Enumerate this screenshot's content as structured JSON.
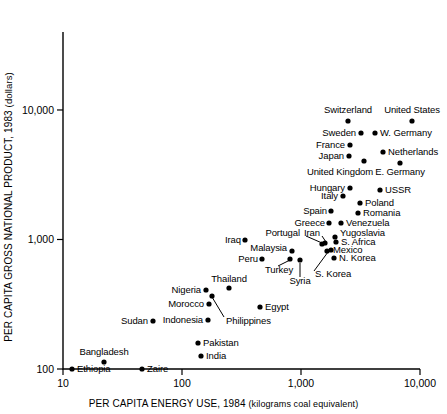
{
  "chart_data": {
    "type": "scatter",
    "title": "",
    "xlabel": "PER CAPITA ENERGY USE, 1984",
    "xlabel_unit": "(kilograms coal equivalent)",
    "ylabel": "PER CAPITA GROSS NATIONAL PRODUCT, 1983",
    "ylabel_unit": "(dollars)",
    "xscale": "log",
    "yscale": "log",
    "xlim": [
      10,
      10000
    ],
    "ylim": [
      100,
      40000
    ],
    "grid": false,
    "legend": "none",
    "xticks": [
      {
        "value": 10,
        "label": "10"
      },
      {
        "value": 100,
        "label": "100"
      },
      {
        "value": 1000,
        "label": "1,000"
      },
      {
        "value": 10000,
        "label": "10,000"
      }
    ],
    "yticks": [
      {
        "value": 100,
        "label": "100"
      },
      {
        "value": 1000,
        "label": "1,000"
      },
      {
        "value": 10000,
        "label": "10,000"
      }
    ],
    "points": [
      {
        "name": "Switzerland",
        "x": 4000,
        "y": 16800,
        "label_pos": "above",
        "px": 348,
        "py": 121,
        "lx": 348,
        "ly": 110,
        "anchor": "c"
      },
      {
        "name": "United States",
        "x": 9500,
        "y": 16800,
        "label_pos": "above",
        "px": 412,
        "py": 121,
        "lx": 412,
        "ly": 110,
        "anchor": "c"
      },
      {
        "name": "Sweden",
        "x": 4700,
        "y": 12500,
        "label_pos": "left",
        "px": 361,
        "py": 133,
        "lx": 356,
        "ly": 133,
        "anchor": "r"
      },
      {
        "name": "W. Germany",
        "x": 5400,
        "y": 12500,
        "label_pos": "right",
        "px": 375,
        "py": 133,
        "lx": 380,
        "ly": 133,
        "anchor": "l"
      },
      {
        "name": "France",
        "x": 4000,
        "y": 10200,
        "label_pos": "left",
        "px": 350,
        "py": 145,
        "lx": 345,
        "ly": 145,
        "anchor": "r"
      },
      {
        "name": "Netherlands",
        "x": 6600,
        "y": 9200,
        "label_pos": "right",
        "px": 383,
        "py": 152,
        "lx": 388,
        "ly": 152,
        "anchor": "l"
      },
      {
        "name": "Japan",
        "x": 4000,
        "y": 9100,
        "label_pos": "left",
        "px": 349,
        "py": 156,
        "lx": 344,
        "ly": 156,
        "anchor": "r"
      },
      {
        "name": "United Kingdom",
        "x": 4800,
        "y": 8200,
        "label_pos": "below",
        "px": 364,
        "py": 161,
        "lx": 340,
        "ly": 172,
        "anchor": "c"
      },
      {
        "name": "E. Germany",
        "x": 7800,
        "y": 8000,
        "label_pos": "below",
        "px": 400,
        "py": 163,
        "lx": 400,
        "ly": 172,
        "anchor": "c"
      },
      {
        "name": "Hungary",
        "x": 4100,
        "y": 5000,
        "label_pos": "left",
        "px": 350,
        "py": 188,
        "lx": 345,
        "ly": 188,
        "anchor": "r"
      },
      {
        "name": "USSR",
        "x": 5900,
        "y": 4900,
        "label_pos": "right",
        "px": 380,
        "py": 190,
        "lx": 385,
        "ly": 190,
        "anchor": "l"
      },
      {
        "name": "Italy",
        "x": 3400,
        "y": 4400,
        "label_pos": "left",
        "px": 343,
        "py": 196,
        "lx": 338,
        "ly": 196,
        "anchor": "r"
      },
      {
        "name": "Poland",
        "x": 4600,
        "y": 3700,
        "label_pos": "right",
        "px": 360,
        "py": 203,
        "lx": 365,
        "ly": 203,
        "anchor": "l"
      },
      {
        "name": "Spain",
        "x": 2700,
        "y": 3200,
        "label_pos": "left",
        "px": 331,
        "py": 211,
        "lx": 327,
        "ly": 211,
        "anchor": "r"
      },
      {
        "name": "Romania",
        "x": 4400,
        "y": 3100,
        "label_pos": "right",
        "px": 358,
        "py": 213,
        "lx": 363,
        "ly": 213,
        "anchor": "l"
      },
      {
        "name": "Greece",
        "x": 2500,
        "y": 2500,
        "label_pos": "left",
        "px": 329,
        "py": 223,
        "lx": 325,
        "ly": 223,
        "anchor": "r"
      },
      {
        "name": "Venezuela",
        "x": 3000,
        "y": 2500,
        "label_pos": "right",
        "px": 341,
        "py": 223,
        "lx": 346,
        "ly": 223,
        "anchor": "l"
      },
      {
        "name": "Yugoslavia",
        "x": 2200,
        "y": 1900,
        "label_pos": "right",
        "px": 335,
        "py": 237,
        "lx": 340,
        "ly": 233,
        "anchor": "l"
      },
      {
        "name": "S. Africa",
        "x": 2300,
        "y": 1700,
        "label_pos": "right",
        "px": 336,
        "py": 242,
        "lx": 341,
        "ly": 242,
        "anchor": "l"
      },
      {
        "name": "Iran",
        "x": 1700,
        "y": 1600,
        "label_pos": "leader",
        "px": 325,
        "py": 243,
        "lx": 320,
        "ly": 233,
        "anchor": "r"
      },
      {
        "name": "Portugal",
        "x": 1100,
        "y": 1600,
        "label_pos": "leader",
        "px": 322,
        "py": 244,
        "lx": 300,
        "ly": 233,
        "anchor": "r"
      },
      {
        "name": "Mexico",
        "x": 1900,
        "y": 1300,
        "label_pos": "leader",
        "px": 331,
        "py": 250,
        "lx": 333,
        "ly": 250,
        "anchor": "l"
      },
      {
        "name": "Iraq",
        "x": 800,
        "y": 1500,
        "label_pos": "right",
        "px": 245,
        "py": 240,
        "lx": 241,
        "ly": 240,
        "anchor": "r"
      },
      {
        "name": "Malaysia",
        "x": 900,
        "y": 1200,
        "label_pos": "left",
        "px": 292,
        "py": 251,
        "lx": 287,
        "ly": 248,
        "anchor": "r"
      },
      {
        "name": "N. Korea",
        "x": 2100,
        "y": 1100,
        "label_pos": "right",
        "px": 334,
        "py": 258,
        "lx": 339,
        "ly": 258,
        "anchor": "l"
      },
      {
        "name": "Peru",
        "x": 620,
        "y": 1000,
        "label_pos": "left",
        "px": 262,
        "py": 259,
        "lx": 258,
        "ly": 259,
        "anchor": "r"
      },
      {
        "name": "Turkey",
        "x": 800,
        "y": 1050,
        "label_pos": "leader",
        "px": 290,
        "py": 259,
        "lx": 265,
        "ly": 270,
        "anchor": "l"
      },
      {
        "name": "Syria",
        "x": 1000,
        "y": 1000,
        "label_pos": "leader",
        "px": 300,
        "py": 260,
        "lx": 300,
        "ly": 281,
        "anchor": "c"
      },
      {
        "name": "S. Korea",
        "x": 1500,
        "y": 1000,
        "label_pos": "leader",
        "px": 327,
        "py": 251,
        "lx": 315,
        "ly": 274,
        "anchor": "l"
      },
      {
        "name": "Thailand",
        "x": 250,
        "y": 600,
        "label_pos": "above",
        "px": 229,
        "py": 288,
        "lx": 229,
        "ly": 279,
        "anchor": "c"
      },
      {
        "name": "Nigeria",
        "x": 160,
        "y": 580,
        "label_pos": "left",
        "px": 206,
        "py": 290,
        "lx": 201,
        "ly": 290,
        "anchor": "r"
      },
      {
        "name": "Philippines",
        "x": 180,
        "y": 520,
        "label_pos": "leader",
        "px": 212,
        "py": 296,
        "lx": 226,
        "ly": 321,
        "anchor": "l"
      },
      {
        "name": "Morocco",
        "x": 170,
        "y": 420,
        "label_pos": "left",
        "px": 209,
        "py": 304,
        "lx": 204,
        "ly": 304,
        "anchor": "r"
      },
      {
        "name": "Egypt",
        "x": 490,
        "y": 400,
        "label_pos": "right",
        "px": 260,
        "py": 307,
        "lx": 265,
        "ly": 307,
        "anchor": "l"
      },
      {
        "name": "Indonesia",
        "x": 170,
        "y": 320,
        "label_pos": "left",
        "px": 208,
        "py": 320,
        "lx": 203,
        "ly": 320,
        "anchor": "r"
      },
      {
        "name": "Sudan",
        "x": 55,
        "y": 310,
        "label_pos": "left",
        "px": 153,
        "py": 321,
        "lx": 148,
        "ly": 321,
        "anchor": "r"
      },
      {
        "name": "Pakistan",
        "x": 130,
        "y": 190,
        "label_pos": "right",
        "px": 198,
        "py": 343,
        "lx": 203,
        "ly": 343,
        "anchor": "l"
      },
      {
        "name": "India",
        "x": 140,
        "y": 140,
        "label_pos": "right",
        "px": 201,
        "py": 356,
        "lx": 206,
        "ly": 356,
        "anchor": "l"
      },
      {
        "name": "Bangladesh",
        "x": 23,
        "y": 125,
        "label_pos": "above",
        "px": 104,
        "py": 362,
        "lx": 104,
        "ly": 352,
        "anchor": "c"
      },
      {
        "name": "Zaire",
        "x": 44,
        "y": 105,
        "label_pos": "right",
        "px": 142,
        "py": 369,
        "lx": 147,
        "ly": 369,
        "anchor": "l"
      },
      {
        "name": "Ethiopia",
        "x": 13,
        "y": 105,
        "label_pos": "right",
        "px": 72,
        "py": 369,
        "lx": 77,
        "ly": 369,
        "anchor": "l"
      }
    ],
    "leaders": [
      {
        "name": "portugal-leader",
        "x1": 306,
        "y1": 236,
        "x2": 322,
        "y2": 243
      },
      {
        "name": "iran-leader",
        "x1": 322,
        "y1": 236,
        "x2": 326,
        "y2": 242
      },
      {
        "name": "mexico-leader",
        "x1": 331,
        "y1": 248,
        "x2": 331,
        "y2": 252
      },
      {
        "name": "s-korea-leader",
        "x1": 314,
        "y1": 271,
        "x2": 328,
        "y2": 252
      },
      {
        "name": "syria-leader",
        "x1": 300,
        "y1": 277,
        "x2": 300,
        "y2": 263
      },
      {
        "name": "turkey-leader",
        "x1": 278,
        "y1": 266,
        "x2": 290,
        "y2": 260
      },
      {
        "name": "philippines-leader",
        "x1": 224,
        "y1": 317,
        "x2": 212,
        "y2": 297
      }
    ]
  },
  "axes": {
    "x_title": "PER CAPITA ENERGY USE, 1984",
    "x_unit": "(kilograms coal equivalent)",
    "y_title": "PER CAPITA GROSS NATIONAL PRODUCT, 1983",
    "y_unit": "(dollars)"
  }
}
